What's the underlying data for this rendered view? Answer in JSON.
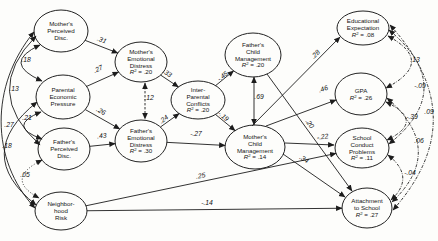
{
  "diagram": {
    "type": "structural-equation-model-path-diagram",
    "nodes": [
      {
        "id": "mothers-perceived-disc",
        "lines": [
          "Mother's",
          "Perceived",
          "Disc."
        ],
        "r2_text": null,
        "cx": 61,
        "cy": 31,
        "rx": 27,
        "ry": 21
      },
      {
        "id": "parental-economic-pressure",
        "lines": [
          "Parental",
          "Economic",
          "Pressure"
        ],
        "r2_text": null,
        "cx": 63,
        "cy": 97,
        "rx": 27,
        "ry": 22
      },
      {
        "id": "fathers-perceived-disc",
        "lines": [
          "Father's",
          "Perceived",
          "Disc."
        ],
        "r2_text": null,
        "cx": 64,
        "cy": 149,
        "rx": 26,
        "ry": 21
      },
      {
        "id": "neighborhood-risk",
        "lines": [
          "Neighbor-",
          "hood",
          "Risk"
        ],
        "r2_text": null,
        "cx": 61,
        "cy": 211,
        "rx": 26,
        "ry": 19
      },
      {
        "id": "mothers-emotional-distress",
        "lines": [
          "Mother's",
          "Emotional",
          "Distress"
        ],
        "r2_text": "R² = .20",
        "cx": 141,
        "cy": 62,
        "rx": 26,
        "ry": 20
      },
      {
        "id": "fathers-emotional-distress",
        "lines": [
          "Father's",
          "Emotional",
          "Distress"
        ],
        "r2_text": "R² = .30",
        "cx": 141,
        "cy": 141,
        "rx": 26,
        "ry": 21
      },
      {
        "id": "inter-parental-conflicts",
        "lines": [
          "Inter-",
          "Parental",
          "Conflicts"
        ],
        "r2_text": "R² = .20",
        "cx": 198,
        "cy": 100,
        "rx": 27,
        "ry": 19
      },
      {
        "id": "fathers-child-management",
        "lines": [
          "Father's",
          "Child",
          "Management"
        ],
        "r2_text": "R² = .20",
        "cx": 253,
        "cy": 55,
        "rx": 28,
        "ry": 22
      },
      {
        "id": "mothers-child-management",
        "lines": [
          "Mother's",
          "Child",
          "Management"
        ],
        "r2_text": "R² = .14",
        "cx": 255,
        "cy": 147,
        "rx": 30,
        "ry": 22
      },
      {
        "id": "educational-expectation",
        "lines": [
          "Educational",
          "Expectation"
        ],
        "r2_text": "R² = .08",
        "cx": 363,
        "cy": 28,
        "rx": 26,
        "ry": 17
      },
      {
        "id": "gpa",
        "lines": [
          "GPA"
        ],
        "r2_text": "R² = .26",
        "cx": 361,
        "cy": 94,
        "rx": 26,
        "ry": 21
      },
      {
        "id": "school-conduct-problems",
        "lines": [
          "School",
          "Conduct",
          "Problems"
        ],
        "r2_text": "R² = .11",
        "cx": 362,
        "cy": 148,
        "rx": 27,
        "ry": 20
      },
      {
        "id": "attachment-to-school",
        "lines": [
          "Attachment",
          "to School"
        ],
        "r2_text": "R² = .27",
        "cx": 367,
        "cy": 208,
        "rx": 25,
        "ry": 20
      }
    ],
    "edges": [
      {
        "from": "mothers-perceived-disc",
        "to": "mothers-emotional-distress",
        "coef": ".31",
        "style": "solid",
        "two_head": false,
        "label": {
          "x": 101,
          "y": 42,
          "rot": 21
        }
      },
      {
        "from": "parental-economic-pressure",
        "to": "mothers-emotional-distress",
        "coef": ".27",
        "style": "solid",
        "two_head": false,
        "label": {
          "x": 99,
          "y": 71,
          "rot": -24
        }
      },
      {
        "from": "parental-economic-pressure",
        "to": "fathers-emotional-distress",
        "coef": ".26",
        "style": "solid",
        "two_head": false,
        "label": {
          "x": 100,
          "y": 113,
          "rot": 29
        }
      },
      {
        "from": "fathers-perceived-disc",
        "to": "fathers-emotional-distress",
        "coef": ".43",
        "style": "solid",
        "two_head": false,
        "label": {
          "x": 102,
          "y": 138,
          "rot": -6
        }
      },
      {
        "from": "mothers-emotional-distress",
        "to": "inter-parental-conflicts",
        "coef": ".33",
        "style": "solid",
        "two_head": false,
        "label": {
          "x": 166,
          "y": 75,
          "rot": 34
        }
      },
      {
        "from": "fathers-emotional-distress",
        "to": "inter-parental-conflicts",
        "coef": ".24",
        "style": "solid",
        "two_head": false,
        "label": {
          "x": 165,
          "y": 121,
          "rot": -36
        }
      },
      {
        "from": "inter-parental-conflicts",
        "to": "fathers-child-management",
        "coef": "-.45",
        "style": "solid",
        "two_head": false,
        "label": {
          "x": 224,
          "y": 78,
          "rot": -39
        }
      },
      {
        "from": "inter-parental-conflicts",
        "to": "mothers-child-management",
        "coef": "-.19",
        "style": "solid",
        "two_head": false,
        "label": {
          "x": 222,
          "y": 118,
          "rot": 39
        }
      },
      {
        "from": "fathers-emotional-distress",
        "to": "mothers-child-management",
        "coef": "-.27",
        "style": "solid",
        "two_head": false,
        "label": {
          "x": 196,
          "y": 136,
          "rot": 0
        }
      },
      {
        "from": "fathers-child-management",
        "to": "mothers-child-management",
        "coef": ".69",
        "style": "solid",
        "two_head": true,
        "pts": [
          [
            254,
            77
          ],
          [
            254,
            125
          ]
        ],
        "label": {
          "x": 259,
          "y": 99,
          "rot": 0,
          "anchor": "start"
        }
      },
      {
        "from": "mothers-emotional-distress",
        "to": "fathers-emotional-distress",
        "coef": ".12",
        "style": "dashed",
        "two_head": true,
        "pts": [
          [
            145,
            83
          ],
          [
            145,
            119
          ]
        ],
        "label": {
          "x": 149,
          "y": 100,
          "rot": 0,
          "anchor": "start"
        }
      },
      {
        "from": "mothers-child-management",
        "to": "educational-expectation",
        "coef": ".28",
        "style": "solid",
        "two_head": false,
        "pts": [
          [
            252,
            126
          ],
          [
            340,
            37
          ]
        ],
        "label": {
          "x": 317,
          "y": 56,
          "rot": -45
        }
      },
      {
        "from": "mothers-child-management",
        "to": "gpa",
        "coef": ".46",
        "style": "solid",
        "two_head": false,
        "pts": [
          [
            266,
            126
          ],
          [
            336,
            100
          ]
        ],
        "label": {
          "x": 324,
          "y": 91,
          "rot": -20
        }
      },
      {
        "from": "mothers-child-management",
        "to": "school-conduct-problems",
        "coef": "-.22",
        "style": "solid",
        "two_head": false,
        "pts": [
          [
            285,
            143
          ],
          [
            334,
            145
          ]
        ],
        "label": {
          "x": 323,
          "y": 139,
          "rot": -10
        }
      },
      {
        "from": "mothers-child-management",
        "to": "attachment-to-school",
        "coef": ".34",
        "style": "solid",
        "two_head": false,
        "pts": [
          [
            283,
            154
          ],
          [
            345,
            197
          ]
        ],
        "label": {
          "x": 303,
          "y": 161,
          "rot": 31
        }
      },
      {
        "from": "fathers-child-management",
        "to": "attachment-to-school",
        "coef": ".20",
        "style": "solid",
        "two_head": false,
        "pts": [
          [
            267,
            74
          ],
          [
            352,
            191
          ]
        ],
        "label": {
          "x": 308,
          "y": 125,
          "rot": 54
        }
      },
      {
        "from": "neighborhood-risk",
        "to": "school-conduct-problems",
        "coef": ".25",
        "style": "solid",
        "two_head": false,
        "label": {
          "x": 201,
          "y": 178,
          "rot": -10
        }
      },
      {
        "from": "neighborhood-risk",
        "to": "attachment-to-school",
        "coef": "-.14",
        "style": "solid",
        "two_head": false,
        "label": {
          "x": 207,
          "y": 205,
          "rot": 0
        }
      }
    ],
    "covariance_arcs": [
      {
        "between": [
          "mothers-perceived-disc",
          "parental-economic-pressure"
        ],
        "coef": ".18",
        "d": "M 40,45 Q 1,63 42,81",
        "style": "solid",
        "label": {
          "x": 26,
          "y": 62
        }
      },
      {
        "between": [
          "parental-economic-pressure",
          "fathers-perceived-disc"
        ],
        "coef": ".21",
        "d": "M 41,112 Q 6,126 42,139",
        "style": "solid",
        "label": {
          "x": 27,
          "y": 120
        }
      },
      {
        "between": [
          "fathers-perceived-disc",
          "neighborhood-risk"
        ],
        "coef": ".05",
        "d": "M 42,160 Q 4,179 39,198",
        "style": "dotted",
        "label": {
          "x": 25,
          "y": 177
        }
      },
      {
        "between": [
          "mothers-perceived-disc",
          "fathers-perceived-disc"
        ],
        "coef": ".13",
        "d": "M 36,36 Q -19,92 40,145",
        "style": "solid",
        "label": {
          "x": 14,
          "y": 91
        }
      },
      {
        "between": [
          "parental-economic-pressure",
          "neighborhood-risk"
        ],
        "coef": ".18",
        "d": "M 37,102 Q -28,154 36,205",
        "style": "solid",
        "label": {
          "x": 7,
          "y": 148
        }
      },
      {
        "between": [
          "mothers-perceived-disc",
          "neighborhood-risk"
        ],
        "coef": ".27",
        "d": "M 34,32 C -10,85 -10,160 35,208",
        "style": "solid",
        "label": {
          "x": 9,
          "y": 127
        }
      },
      {
        "between": [
          "educational-expectation",
          "gpa"
        ],
        "coef": ".13",
        "d": "M 388,36 Q 436,62 386,88",
        "style": "dashdot",
        "label": {
          "x": 415,
          "y": 62
        }
      },
      {
        "between": [
          "gpa",
          "school-conduct-problems"
        ],
        "coef": "-.39",
        "d": "M 386,102 Q 426,121 387,140",
        "style": "dashdot",
        "label": {
          "x": 412,
          "y": 119
        }
      },
      {
        "between": [
          "school-conduct-problems",
          "attachment-to-school"
        ],
        "coef": "-.04",
        "d": "M 388,155 Q 416,177 391,200",
        "style": "dashdot",
        "label": {
          "x": 410,
          "y": 175
        }
      },
      {
        "between": [
          "educational-expectation",
          "school-conduct-problems"
        ],
        "coef": "-.09",
        "d": "M 389,30 Q 459,88 389,144",
        "style": "dashdot",
        "label": {
          "x": 420,
          "y": 88
        }
      },
      {
        "between": [
          "gpa",
          "attachment-to-school"
        ],
        "coef": ".06",
        "d": "M 387,98 Q 447,150 392,202",
        "style": "dashdot",
        "label": {
          "x": 419,
          "y": 143
        }
      },
      {
        "between": [
          "educational-expectation",
          "attachment-to-school"
        ],
        "coef": ".09",
        "d": "M 390,25 Q 475,118 393,210",
        "style": "dashdot",
        "label": {
          "x": 429,
          "y": 114
        }
      }
    ]
  }
}
